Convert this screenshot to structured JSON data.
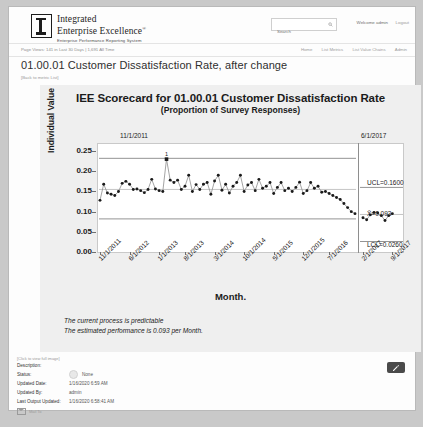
{
  "header": {
    "logo_line1": "Integrated",
    "logo_line2": "Enterprise Excellence",
    "logo_sup": "®",
    "logo_tagline": "Enterprise Performance Reporting System",
    "search_placeholder": "Search",
    "search_value": "",
    "welcome": "Welcome admin",
    "logout": "Logout"
  },
  "subbar": {
    "page_views": "Page Views: 141 in Last 30 Days | 1,691 All Time",
    "nav": [
      "Home",
      "List Metrics",
      "List Value Chains",
      "Admin"
    ]
  },
  "page": {
    "title": "01.00.01 Customer Dissatisfaction Rate, after change",
    "back_link": "[Back to metric List]"
  },
  "chart_data": {
    "type": "line",
    "title": "IEE Scorecard for 01.00.01 Customer Dissatisfaction Rate",
    "subtitle": "(Proportion of Survey Responses)",
    "xlabel": "Month.",
    "ylabel": "Individual Value",
    "ylim": [
      0.0,
      0.27
    ],
    "yticks": [
      0.0,
      0.05,
      0.1,
      0.15,
      0.2,
      0.25
    ],
    "ytick_labels": [
      "0.00",
      "0.05",
      "0.10",
      "0.15",
      "0.20",
      "0.25"
    ],
    "grid": false,
    "legend": "none",
    "xtick_labels": [
      "11/1/2011",
      "6/1/2012",
      "1/1/2013",
      "8/1/2013",
      "3/1/2014",
      "10/1/2014",
      "5/1/2015",
      "12/1/2015",
      "7/1/2016",
      "2/1/2017",
      "9/1/2017"
    ],
    "stage_labels": [
      "11/1/2011",
      "6/1/2017"
    ],
    "control_limits": {
      "ucl_label": "UCL=0.1600",
      "center_label": "X̄=0.093",
      "lcl_label": "LCL=0.0260",
      "ucl": 0.16,
      "center": 0.093,
      "lcl": 0.026
    },
    "violation_point_label": "1",
    "series": [
      {
        "name": "Individual Value",
        "values": [
          0.128,
          0.168,
          0.146,
          0.143,
          0.14,
          0.15,
          0.17,
          0.175,
          0.168,
          0.155,
          0.156,
          0.152,
          0.147,
          0.155,
          0.18,
          0.156,
          0.152,
          0.15,
          0.23,
          0.178,
          0.172,
          0.178,
          0.155,
          0.163,
          0.19,
          0.15,
          0.167,
          0.155,
          0.168,
          0.172,
          0.143,
          0.176,
          0.19,
          0.153,
          0.168,
          0.146,
          0.163,
          0.172,
          0.19,
          0.15,
          0.166,
          0.172,
          0.152,
          0.18,
          0.158,
          0.163,
          0.172,
          0.145,
          0.16,
          0.172,
          0.152,
          0.158,
          0.15,
          0.16,
          0.173,
          0.145,
          0.152,
          0.172,
          0.158,
          0.163,
          0.148,
          0.15,
          0.145,
          0.14,
          0.135,
          0.13,
          0.12,
          0.11,
          0.1,
          0.095,
          0.085,
          0.08,
          0.092,
          0.098,
          0.097,
          0.09,
          0.078,
          0.09,
          0.095
        ]
      }
    ],
    "notes": [
      "The current process is predictable",
      "The estimated performance is 0.093 per Month."
    ]
  },
  "meta": {
    "hint": "[Click to view full image]",
    "rows": [
      {
        "label": "Description:",
        "value": ""
      },
      {
        "label": "Status:",
        "value": "None"
      },
      {
        "label": "Updated Date:",
        "value": "1/16/2020 6:59 AM"
      },
      {
        "label": "Updated By:",
        "value": "admin"
      },
      {
        "label": "Last Output Updated:",
        "value": "1/16/2020 6:58:41 AM"
      }
    ],
    "mail_label": "Mail To",
    "edit_icon": "pencil-icon"
  }
}
